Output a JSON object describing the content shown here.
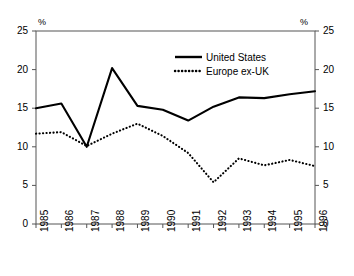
{
  "chart_data": {
    "type": "line",
    "title": "",
    "xlabel": "",
    "ylabel": "%",
    "ylabel_right": "%",
    "ylim": [
      0,
      25
    ],
    "yticks": [
      0,
      5,
      10,
      15,
      20,
      25
    ],
    "grid": false,
    "legend_position": "top-center",
    "categories": [
      "1985",
      "1986",
      "1987",
      "1988",
      "1989",
      "1990",
      "1991",
      "1992",
      "1993",
      "1994",
      "1995",
      "1996"
    ],
    "series": [
      {
        "name": "United States",
        "style": "solid",
        "color": "#000000",
        "values": [
          15.0,
          15.6,
          10.0,
          20.2,
          15.3,
          14.8,
          13.4,
          15.2,
          16.4,
          16.3,
          16.8,
          17.2
        ]
      },
      {
        "name": "Europe ex-UK",
        "style": "dotted",
        "color": "#000000",
        "values": [
          11.7,
          11.9,
          10.1,
          11.7,
          13.0,
          11.4,
          9.2,
          5.4,
          8.5,
          7.6,
          8.3,
          7.5
        ]
      }
    ]
  },
  "axes": {
    "unit_left": "%",
    "unit_right": "%",
    "ytick_labels": [
      "25",
      "20",
      "15",
      "10",
      "5",
      "0"
    ],
    "xtick_labels": [
      "1985",
      "1986",
      "1987",
      "1988",
      "1989",
      "1990",
      "1991",
      "1992",
      "1993",
      "1994",
      "1995",
      "1996"
    ]
  },
  "legend": {
    "items": [
      {
        "label": "United States",
        "style": "solid"
      },
      {
        "label": "Europe ex-UK",
        "style": "dotted"
      }
    ]
  }
}
